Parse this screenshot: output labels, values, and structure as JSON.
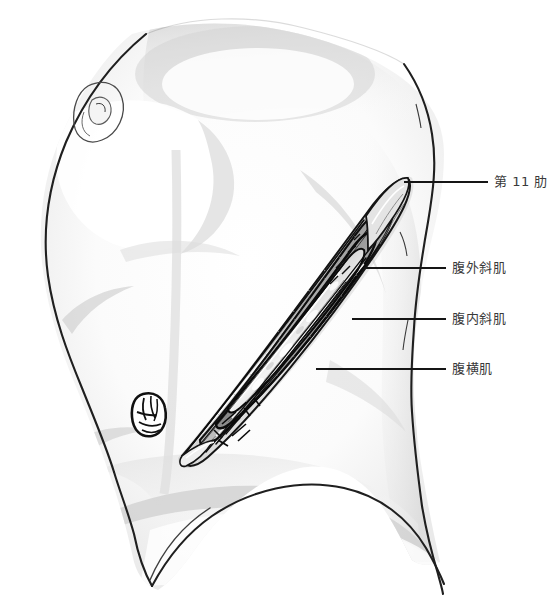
{
  "figure": {
    "title": "",
    "type": "medical-anatomical-illustration",
    "orientation": "left lateral torso, head to upper-left, feet to lower-right",
    "background_color": "#ffffff",
    "ink_color": "#1a1a1a",
    "shade_color": "#c9c9c9",
    "leader_color": "#1a1a1a"
  },
  "labels": [
    {
      "id": "rib11",
      "text": "第 11 肋",
      "meaning": "11th rib",
      "text_x": 494,
      "text_y": 182,
      "leader": {
        "x1": 404,
        "y1": 182,
        "x2": 488,
        "y2": 182
      },
      "target": "upper (cranial) apex of the incision"
    },
    {
      "id": "external-oblique",
      "text": "腹外斜肌",
      "meaning": "external oblique muscle",
      "text_x": 452,
      "text_y": 268,
      "leader": {
        "x1": 364,
        "y1": 268,
        "x2": 446,
        "y2": 268
      },
      "target": "outermost divided muscle layer of the incision"
    },
    {
      "id": "internal-oblique",
      "text": "腹内斜肌",
      "meaning": "internal oblique muscle",
      "text_x": 452,
      "text_y": 319,
      "leader": {
        "x1": 352,
        "y1": 319,
        "x2": 446,
        "y2": 319
      },
      "target": "middle divided muscle layer of the incision"
    },
    {
      "id": "transversus-abdominis",
      "text": "腹横肌",
      "meaning": "transverse abdominis muscle",
      "text_x": 452,
      "text_y": 369,
      "leader": {
        "x1": 316,
        "y1": 369,
        "x2": 446,
        "y2": 369
      },
      "target": "deepest divided muscle layer of the incision"
    }
  ],
  "anatomy_features": [
    {
      "name": "nipple",
      "x": 103,
      "y": 112
    },
    {
      "name": "umbilicus",
      "x": 152,
      "y": 412
    },
    {
      "name": "incision",
      "x_from": 180,
      "y_from": 455,
      "x_to": 410,
      "y_to": 180
    }
  ]
}
